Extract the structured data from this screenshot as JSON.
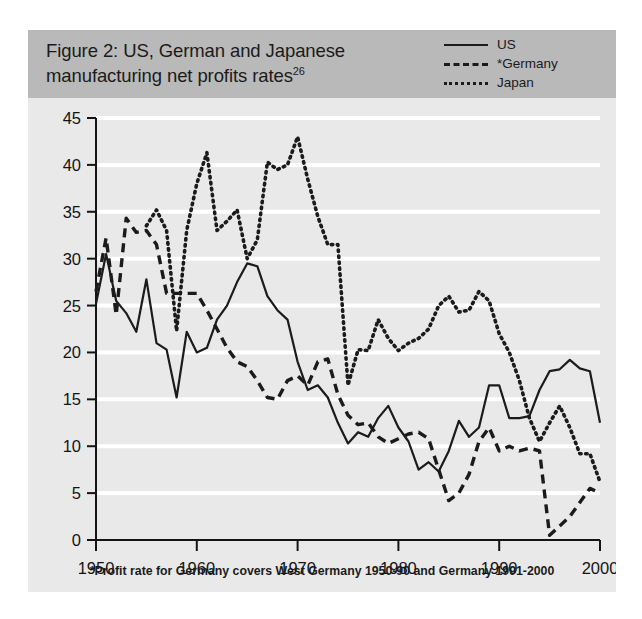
{
  "figure": {
    "title": "Figure 2: US, German and Japanese manufacturing net profits rates",
    "title_superscript": "26",
    "footnote": "*Profit rate for Germany covers West Germany 1950-90 and Germany 1991-2000",
    "band_color": "#b9b9b9",
    "plot_background": "#e9e9e9",
    "gridline_color": "#ffffff",
    "line_color": "#1b1b1b"
  },
  "legend": {
    "position": "top-right",
    "items": [
      {
        "label": "US",
        "style": "solid"
      },
      {
        "label": "*Germany",
        "style": "dashed"
      },
      {
        "label": "Japan",
        "style": "dotted"
      }
    ]
  },
  "chart_data": {
    "type": "line",
    "title": "Figure 2: US, German and Japanese manufacturing net profits rates",
    "xlabel": "",
    "ylabel": "",
    "xlim": [
      1950,
      2000
    ],
    "ylim": [
      0,
      45
    ],
    "grid": true,
    "legend_position": "top-right",
    "xticks": [
      1950,
      1960,
      1970,
      1980,
      1990,
      2000
    ],
    "yticks": [
      0,
      5,
      10,
      15,
      20,
      25,
      30,
      35,
      40,
      45
    ],
    "x": [
      1950,
      1951,
      1952,
      1953,
      1954,
      1955,
      1956,
      1957,
      1958,
      1959,
      1960,
      1961,
      1962,
      1963,
      1964,
      1965,
      1966,
      1967,
      1968,
      1969,
      1970,
      1971,
      1972,
      1973,
      1974,
      1975,
      1976,
      1977,
      1978,
      1979,
      1980,
      1981,
      1982,
      1983,
      1984,
      1985,
      1986,
      1987,
      1988,
      1989,
      1990,
      1991,
      1992,
      1993,
      1994,
      1995,
      1996,
      1997,
      1998,
      1999,
      2000
    ],
    "series": [
      {
        "name": "US",
        "style": "solid",
        "values": [
          25.2,
          30.5,
          25.5,
          24.2,
          22.2,
          27.8,
          21.0,
          20.3,
          15.2,
          22.2,
          20.0,
          20.5,
          23.5,
          25.0,
          27.5,
          29.5,
          29.2,
          26.0,
          24.5,
          23.5,
          19.0,
          16.0,
          16.5,
          15.2,
          12.5,
          10.3,
          11.5,
          11.0,
          13.0,
          14.3,
          12.0,
          10.5,
          7.5,
          8.3,
          7.3,
          9.5,
          12.7,
          11.0,
          12.0,
          16.5,
          16.5,
          13.0,
          13.0,
          13.2,
          16.0,
          18.0,
          18.2,
          19.2,
          18.3,
          18.0,
          12.5
        ]
      },
      {
        "name": "*Germany",
        "style": "dashed",
        "values": [
          26.5,
          32.2,
          24.0,
          34.3,
          32.8,
          33.0,
          31.5,
          26.3,
          26.3,
          26.3,
          26.3,
          24.5,
          22.5,
          20.5,
          19.0,
          18.5,
          17.0,
          15.2,
          15.0,
          17.0,
          17.5,
          16.5,
          19.0,
          19.3,
          15.5,
          13.3,
          12.3,
          12.5,
          11.0,
          10.3,
          10.8,
          11.3,
          11.5,
          10.8,
          7.5,
          4.2,
          5.0,
          7.0,
          10.5,
          12.0,
          9.5,
          10.0,
          9.5,
          9.8,
          9.5,
          0.5,
          1.5,
          2.5,
          4.0,
          5.5,
          5.0
        ]
      },
      {
        "name": "Japan",
        "style": "dotted",
        "values": [
          null,
          null,
          null,
          null,
          null,
          33.5,
          35.2,
          33.0,
          22.3,
          33.0,
          38.0,
          41.3,
          33.0,
          34.0,
          35.2,
          30.0,
          32.0,
          40.3,
          39.5,
          40.0,
          43.0,
          38.5,
          34.5,
          31.5,
          31.5,
          16.5,
          20.3,
          20.2,
          23.5,
          21.5,
          20.2,
          21.0,
          21.5,
          22.5,
          25.0,
          26.0,
          24.3,
          24.5,
          26.5,
          25.5,
          22.0,
          20.0,
          17.0,
          13.0,
          10.5,
          12.5,
          14.3,
          12.0,
          9.2,
          9.2,
          6.2
        ]
      }
    ]
  }
}
